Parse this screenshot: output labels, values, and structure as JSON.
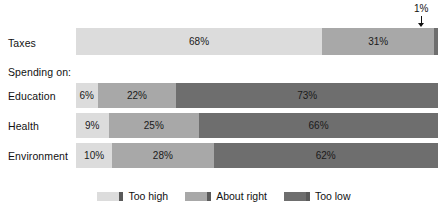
{
  "chart_data": {
    "type": "bar",
    "orientation": "horizontal",
    "stacked": true,
    "normalized_percent": true,
    "title": "",
    "subtitle": "",
    "xlabel": "",
    "ylabel": "",
    "xlim": [
      0,
      100
    ],
    "grid": false,
    "legend_position": "bottom-center",
    "categories": [
      "Taxes",
      "Education",
      "Health",
      "Environment"
    ],
    "group_header": "Spending on:",
    "series": [
      {
        "name": "Too high",
        "color": "#dcdcdc",
        "values": [
          68,
          6,
          9,
          10
        ]
      },
      {
        "name": "About right",
        "color": "#a8a8a8",
        "values": [
          31,
          22,
          25,
          28
        ]
      },
      {
        "name": "Too low",
        "color": "#6e6e6e",
        "values": [
          1,
          73,
          66,
          62
        ]
      }
    ],
    "annotations": [
      {
        "text": "1%",
        "points_to": "Taxes / Too low",
        "style": "arrow-down"
      }
    ]
  },
  "rows": [
    {
      "label": "Taxes",
      "segments": [
        {
          "key": "high",
          "value": 68,
          "label": "68%",
          "show_label": true
        },
        {
          "key": "right",
          "value": 31,
          "label": "31%",
          "show_label": true
        },
        {
          "key": "low",
          "value": 1,
          "label": "1%",
          "show_label": false
        }
      ]
    },
    {
      "label": "Education",
      "segments": [
        {
          "key": "high",
          "value": 6,
          "label": "6%",
          "show_label": true
        },
        {
          "key": "right",
          "value": 22,
          "label": "22%",
          "show_label": true
        },
        {
          "key": "low",
          "value": 73,
          "label": "73%",
          "show_label": true
        }
      ]
    },
    {
      "label": "Health",
      "segments": [
        {
          "key": "high",
          "value": 9,
          "label": "9%",
          "show_label": true
        },
        {
          "key": "right",
          "value": 25,
          "label": "25%",
          "show_label": true
        },
        {
          "key": "low",
          "value": 66,
          "label": "66%",
          "show_label": true
        }
      ]
    },
    {
      "label": "Environment",
      "segments": [
        {
          "key": "high",
          "value": 10,
          "label": "10%",
          "show_label": true
        },
        {
          "key": "right",
          "value": 28,
          "label": "28%",
          "show_label": true
        },
        {
          "key": "low",
          "value": 62,
          "label": "62%",
          "show_label": true
        }
      ]
    }
  ],
  "group_header": {
    "label": "Spending on:"
  },
  "callout": {
    "label": "1%"
  },
  "legend": {
    "items": [
      {
        "label": "Too high",
        "color": "#dcdcdc"
      },
      {
        "label": "About right",
        "color": "#a8a8a8"
      },
      {
        "label": "Too low",
        "color": "#6e6e6e"
      }
    ]
  }
}
